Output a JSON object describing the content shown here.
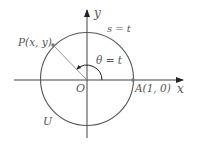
{
  "diagram": {
    "labels": {
      "y_axis": "y",
      "x_axis": "x",
      "arc": "s = t",
      "point_p": "P(x, y)",
      "angle": "θ = t",
      "origin": "O",
      "point_a": "A(1, 0)",
      "circle": "U"
    },
    "colors": {
      "axis": "#222222",
      "circle": "#555555",
      "radius_line": "#888888",
      "point": "#777777",
      "label": "#555555"
    }
  }
}
